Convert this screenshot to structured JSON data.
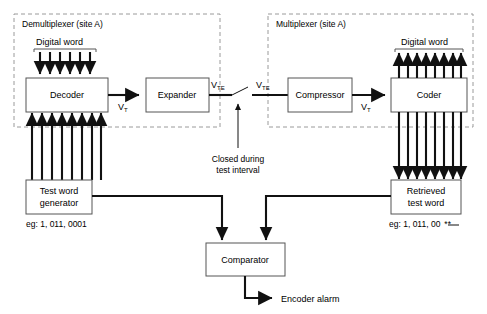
{
  "diagram": {
    "regions": [
      {
        "id": "demux",
        "label": "Demultiplexer (site A)"
      },
      {
        "id": "mux",
        "label": "Multiplexer (site A)"
      }
    ],
    "blocks": [
      {
        "id": "decoder",
        "label": "Decoder"
      },
      {
        "id": "expander",
        "label": "Expander"
      },
      {
        "id": "compressor",
        "label": "Compressor"
      },
      {
        "id": "coder",
        "label": "Coder"
      },
      {
        "id": "test-word-generator",
        "label_line1": "Test word",
        "label_line2": "generator"
      },
      {
        "id": "retrieved-test-word",
        "label_line1": "Retrieved",
        "label_line2": "test word"
      },
      {
        "id": "comparator",
        "label": "Comparator"
      }
    ],
    "bus_labels": {
      "left_digital_word": "Digital word",
      "right_digital_word": "Digital word"
    },
    "signal_labels": [
      {
        "id": "vt-left",
        "base": "V",
        "sub": "T"
      },
      {
        "id": "vte-left",
        "base": "V",
        "sub": "TE"
      },
      {
        "id": "vte-right",
        "base": "V",
        "sub": "TE"
      },
      {
        "id": "vt-right",
        "base": "V",
        "sub": "T"
      }
    ],
    "switch_note": {
      "line1": "Closed during",
      "line2": "test interval"
    },
    "examples": {
      "generator": "eg: 1, 011, 0001",
      "retrieved": "eg: 1, 011, 00",
      "retrieved_marked": "**"
    },
    "output": {
      "alarm_label": "Encoder alarm"
    },
    "bus_counts": {
      "decoder_top_arrows": 6,
      "decoder_bottom_arrows": 8,
      "coder_top_arrows": 8,
      "coder_bottom_arrows": 8
    },
    "colors": {
      "ink": "#111111",
      "box_stroke": "#555555",
      "dashed_stroke": "#9a9a9a",
      "background": "#ffffff"
    }
  }
}
